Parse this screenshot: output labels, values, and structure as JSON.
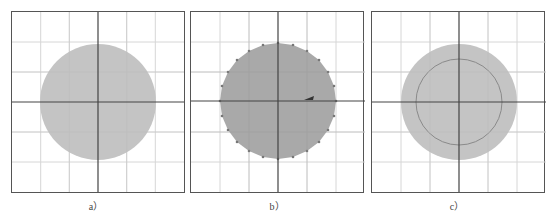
{
  "figure": {
    "panels": [
      {
        "id": "a",
        "caption": "a）",
        "grid": {
          "cols": 6,
          "rows": 6
        },
        "shape": "circle",
        "fill": "#c4c4c4",
        "radius_cells": 2.0,
        "vertices_visible": false,
        "inner_circle": false
      },
      {
        "id": "b",
        "caption": "b）",
        "grid": {
          "cols": 6,
          "rows": 6
        },
        "shape": "polygon-circle",
        "fill": "#a9a9a9",
        "radius_cells": 2.0,
        "vertices_visible": true,
        "vertex_count": 24,
        "marker": "arrow-left-at-right-axis",
        "inner_circle": false
      },
      {
        "id": "c",
        "caption": "c）",
        "grid": {
          "cols": 6,
          "rows": 6
        },
        "shape": "circle",
        "fill": "#c4c4c4",
        "radius_cells": 2.0,
        "vertices_visible": false,
        "inner_circle": true,
        "inner_radius_cells": 1.5,
        "inner_stroke": "#8a8a8a"
      }
    ],
    "colors": {
      "grid_minor": "#d6d6d6",
      "axis": "#444444",
      "border": "#555555"
    }
  }
}
